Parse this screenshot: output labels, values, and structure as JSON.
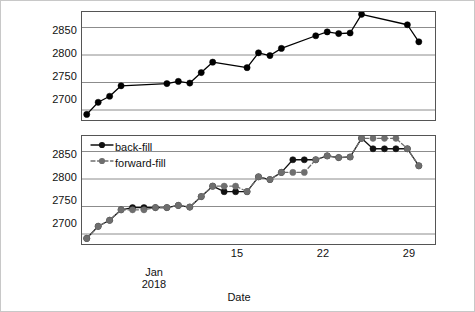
{
  "chart_data": [
    {
      "type": "line",
      "panel": "top",
      "title": "",
      "xlabel": "Date",
      "ylabel": "",
      "ylim": [
        2680,
        2880
      ],
      "xlim": [
        0.5,
        31.5
      ],
      "yticks": [
        2700,
        2750,
        2800,
        2850
      ],
      "xticks": [
        15,
        22,
        29
      ],
      "xtick_labels": [
        "15",
        "22",
        "29"
      ],
      "grid": true,
      "legend": false,
      "series": [
        {
          "name": "observed",
          "color": "#000000",
          "marker": "circle",
          "linestyle": "solid",
          "points": [
            {
              "x": 1,
              "y": 2692
            },
            {
              "x": 2,
              "y": 2714
            },
            {
              "x": 3,
              "y": 2725
            },
            {
              "x": 4,
              "y": 2744
            },
            {
              "x": 8,
              "y": 2748
            },
            {
              "x": 9,
              "y": 2752
            },
            {
              "x": 10,
              "y": 2749
            },
            {
              "x": 11,
              "y": 2768
            },
            {
              "x": 12,
              "y": 2787
            },
            {
              "x": 15,
              "y": 2777
            },
            {
              "x": 16,
              "y": 2804
            },
            {
              "x": 17,
              "y": 2799
            },
            {
              "x": 18,
              "y": 2812
            },
            {
              "x": 21,
              "y": 2835
            },
            {
              "x": 22,
              "y": 2842
            },
            {
              "x": 23,
              "y": 2839
            },
            {
              "x": 24,
              "y": 2840
            },
            {
              "x": 25,
              "y": 2874
            },
            {
              "x": 29,
              "y": 2855
            },
            {
              "x": 30,
              "y": 2824
            }
          ]
        }
      ]
    },
    {
      "type": "line",
      "panel": "bottom",
      "title": "",
      "xlabel": "Date",
      "ylabel": "",
      "ylim": [
        2680,
        2880
      ],
      "xlim": [
        0.5,
        31.5
      ],
      "yticks": [
        2700,
        2750,
        2800,
        2850
      ],
      "xticks": [
        15,
        22,
        29
      ],
      "xtick_labels": [
        "15",
        "22",
        "29"
      ],
      "grid": true,
      "legend": true,
      "legend_position": "top-left",
      "series": [
        {
          "name": "back-fill",
          "color": "#111111",
          "marker": "circle",
          "linestyle": "solid",
          "points": [
            {
              "x": 1,
              "y": 2692
            },
            {
              "x": 2,
              "y": 2714
            },
            {
              "x": 3,
              "y": 2725
            },
            {
              "x": 4,
              "y": 2744
            },
            {
              "x": 5,
              "y": 2748
            },
            {
              "x": 6,
              "y": 2748
            },
            {
              "x": 7,
              "y": 2748
            },
            {
              "x": 8,
              "y": 2748
            },
            {
              "x": 9,
              "y": 2752
            },
            {
              "x": 10,
              "y": 2749
            },
            {
              "x": 11,
              "y": 2768
            },
            {
              "x": 12,
              "y": 2787
            },
            {
              "x": 13,
              "y": 2777
            },
            {
              "x": 14,
              "y": 2777
            },
            {
              "x": 15,
              "y": 2777
            },
            {
              "x": 16,
              "y": 2804
            },
            {
              "x": 17,
              "y": 2799
            },
            {
              "x": 18,
              "y": 2812
            },
            {
              "x": 19,
              "y": 2835
            },
            {
              "x": 20,
              "y": 2835
            },
            {
              "x": 21,
              "y": 2835
            },
            {
              "x": 22,
              "y": 2842
            },
            {
              "x": 23,
              "y": 2839
            },
            {
              "x": 24,
              "y": 2840
            },
            {
              "x": 25,
              "y": 2874
            },
            {
              "x": 26,
              "y": 2855
            },
            {
              "x": 27,
              "y": 2855
            },
            {
              "x": 28,
              "y": 2855
            },
            {
              "x": 29,
              "y": 2855
            },
            {
              "x": 30,
              "y": 2824
            }
          ]
        },
        {
          "name": "forward-fill",
          "color": "#6e6e6e",
          "marker": "circle",
          "linestyle": "dashed",
          "points": [
            {
              "x": 1,
              "y": 2692
            },
            {
              "x": 2,
              "y": 2714
            },
            {
              "x": 3,
              "y": 2725
            },
            {
              "x": 4,
              "y": 2744
            },
            {
              "x": 5,
              "y": 2744
            },
            {
              "x": 6,
              "y": 2744
            },
            {
              "x": 7,
              "y": 2748
            },
            {
              "x": 8,
              "y": 2748
            },
            {
              "x": 9,
              "y": 2752
            },
            {
              "x": 10,
              "y": 2749
            },
            {
              "x": 11,
              "y": 2768
            },
            {
              "x": 12,
              "y": 2787
            },
            {
              "x": 13,
              "y": 2787
            },
            {
              "x": 14,
              "y": 2787
            },
            {
              "x": 15,
              "y": 2777
            },
            {
              "x": 16,
              "y": 2804
            },
            {
              "x": 17,
              "y": 2799
            },
            {
              "x": 18,
              "y": 2812
            },
            {
              "x": 19,
              "y": 2812
            },
            {
              "x": 20,
              "y": 2812
            },
            {
              "x": 21,
              "y": 2835
            },
            {
              "x": 22,
              "y": 2842
            },
            {
              "x": 23,
              "y": 2839
            },
            {
              "x": 24,
              "y": 2840
            },
            {
              "x": 25,
              "y": 2874
            },
            {
              "x": 26,
              "y": 2874
            },
            {
              "x": 27,
              "y": 2874
            },
            {
              "x": 28,
              "y": 2874
            },
            {
              "x": 29,
              "y": 2855
            },
            {
              "x": 30,
              "y": 2824
            }
          ]
        }
      ]
    }
  ],
  "legend": {
    "items": [
      {
        "label": "back-fill",
        "color": "#111111",
        "linestyle": "solid"
      },
      {
        "label": "forward-fill",
        "color": "#6e6e6e",
        "linestyle": "dashed"
      }
    ]
  },
  "axis": {
    "yticks": [
      "2700",
      "2750",
      "2800",
      "2850"
    ],
    "xtick_labels": [
      "15",
      "22",
      "29"
    ],
    "period_caption_line1": "Jan",
    "period_caption_line2": "2018",
    "xlabel": "Date"
  },
  "colors": {
    "backfill": "#111111",
    "forwardfill": "#6e6e6e",
    "grid": "#8c8c8c",
    "frame": "#555555",
    "outer_border": "#c8c8c8",
    "background": "#ffffff"
  }
}
